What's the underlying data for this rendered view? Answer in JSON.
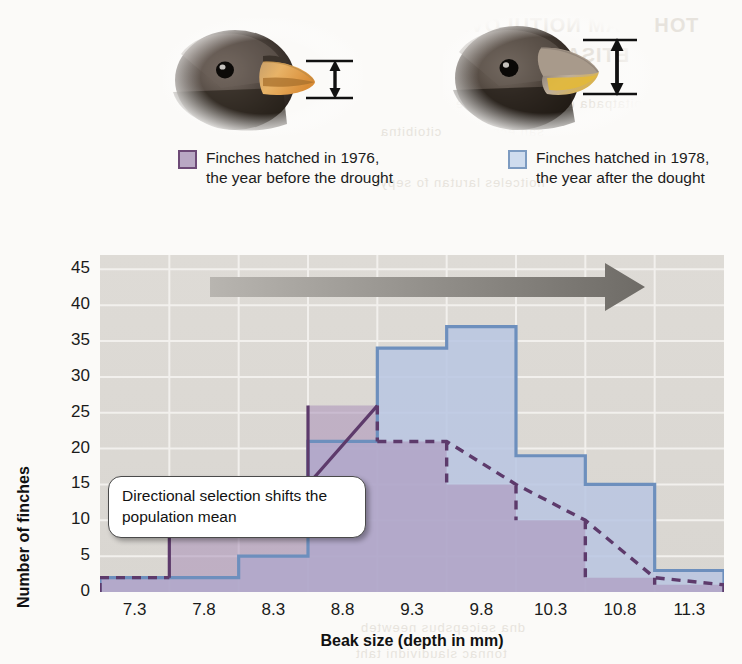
{
  "legend": {
    "items": [
      {
        "swatch_fill": "#b9a8c4",
        "swatch_border": "#6d4a77",
        "line1": "Finches hatched in 1976,",
        "line2": "the year before the drought"
      },
      {
        "swatch_fill": "#cfdcee",
        "swatch_border": "#7d9bc1",
        "line1": "Finches hatched in 1978,",
        "line2": "the year after the dought"
      }
    ]
  },
  "photos": {
    "left_caption_icon": "finch-head-shallow-beak-icon",
    "right_caption_icon": "finch-head-deep-beak-icon",
    "measure_icon": "beak-depth-double-arrow-icon"
  },
  "callout": {
    "text": "Directional selection shifts the population mean",
    "arrow_icon": "rightward-gradient-arrow-icon"
  },
  "chart_data": {
    "type": "bar",
    "title": "",
    "subtitle": "",
    "xlabel": "Beak size (depth in mm)",
    "ylabel": "Number of finches",
    "categories": [
      "7.3",
      "7.8",
      "8.3",
      "8.8",
      "9.3",
      "9.8",
      "10.3",
      "10.8",
      "11.3"
    ],
    "x_tick_labels": [
      "7.3",
      "7.8",
      "8.3",
      "8.8",
      "9.3",
      "9.8",
      "10.3",
      "10.8",
      "11.3"
    ],
    "y_tick_labels": [
      "0",
      "5",
      "10",
      "15",
      "20",
      "25",
      "30",
      "35",
      "40",
      "45"
    ],
    "ylim": [
      0,
      47
    ],
    "xlim": [
      7.05,
      11.55
    ],
    "grid": true,
    "legend_position": "above-plot",
    "series": [
      {
        "name": "Finches hatched in 1976, the year before the drought",
        "style": "step-outline-dashed",
        "fill": "#b9a8c4",
        "stroke": "#5d3a6b",
        "values": [
          2,
          8,
          15,
          26,
          21,
          15,
          10,
          2,
          1
        ]
      },
      {
        "name": "Finches hatched in 1978, the year after the dought",
        "style": "step-outline-solid",
        "fill": "#b9c6e2",
        "stroke": "#6d8fbd",
        "values": [
          2,
          2,
          5,
          21,
          34,
          37,
          19,
          15,
          3
        ]
      }
    ],
    "annotations": [
      {
        "type": "callout",
        "text": "Directional selection shifts the population mean"
      },
      {
        "type": "arrow",
        "direction": "right",
        "meaning": "shift of population mean toward larger beak size"
      }
    ]
  },
  "bleed_through": {
    "l1": "TOHS YAM NOITULOVE",
    "l2": "ETISARAP",
    "l3": "noitatpada dipar fo selpmaxe",
    "l4": "sah ecnatsiser citoibitna",
    "l5": "noitceles larutan fo sepyt",
    "l6": "dna noitceles lanoitcerid",
    "l7": "dna seicepsbus neewteb",
    "l8": "tonnac slaudividni taht"
  }
}
